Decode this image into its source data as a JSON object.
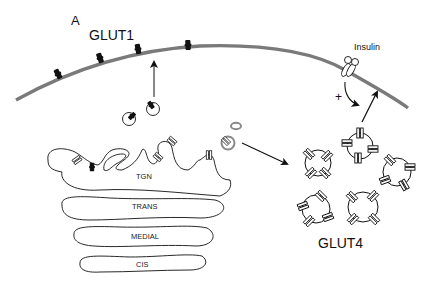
{
  "figure": {
    "panel_label": "A",
    "labels": {
      "glut1": "GLUT1",
      "glut4": "GLUT4",
      "insulin": "Insulin",
      "plus_sign": "+"
    },
    "golgi_cisternae": [
      "TGN",
      "TRANS",
      "MEDIAL",
      "CIS"
    ],
    "colors": {
      "membrane": "#7a7a7a",
      "outline": "#111111",
      "glut1_transporter": "#111111",
      "glut4_transporter": "#ffffff",
      "background": "#ffffff"
    },
    "counts": {
      "glut1_in_membrane": 4,
      "glut1_vesicles": 2,
      "glut4_storage_vesicles": 5
    }
  }
}
